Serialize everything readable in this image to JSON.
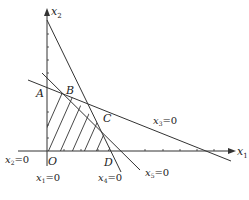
{
  "figure": {
    "type": "linear-programming-feasible-region",
    "axes": {
      "x_axis_label": "x",
      "x_axis_sub": "1",
      "y_axis_label": "x",
      "y_axis_sub": "2",
      "origin_label": "O"
    },
    "points": [
      {
        "label": "A"
      },
      {
        "label": "B"
      },
      {
        "label": "C"
      },
      {
        "label": "D"
      }
    ],
    "constraint_lines": [
      {
        "var": "x",
        "sub": "1",
        "eq": "=0"
      },
      {
        "var": "x",
        "sub": "2",
        "eq": "=0"
      },
      {
        "var": "x",
        "sub": "3",
        "eq": "=0"
      },
      {
        "var": "x",
        "sub": "4",
        "eq": "=0"
      },
      {
        "var": "x",
        "sub": "5",
        "eq": "=0"
      }
    ],
    "feasible_region": "OABCD (hatched)",
    "colors": {
      "line": "#333333",
      "background": "#ffffff"
    }
  }
}
